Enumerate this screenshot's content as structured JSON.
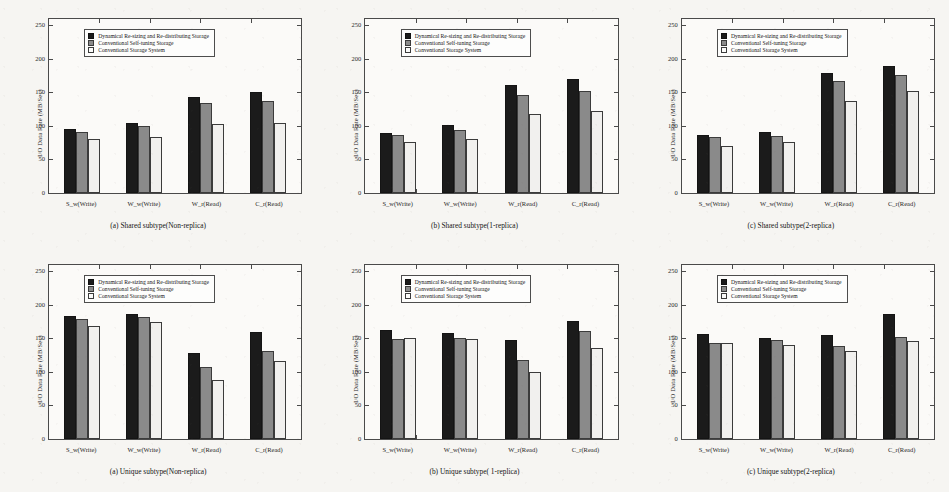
{
  "figure": {
    "ylabel": "I/O Data Rate (MB/Sec)",
    "y_ticks": [
      "0",
      "50",
      "100",
      "150",
      "200",
      "250"
    ],
    "legend": [
      "Dynamical Re-sizing and Re-distributing Storage",
      "Conventional Self-tuning Storage",
      "Conventional Storage System"
    ],
    "colors": {
      "series0": "#1b1b1b",
      "series1": "#8a8a8a",
      "series2": "#f1f0ee",
      "axis": "#4a4a4a",
      "page_background": "#f6f5f2"
    }
  },
  "chart_data": [
    {
      "type": "bar",
      "title": "(a) Shared subtype(Non-replica)",
      "xlabel": "",
      "ylabel": "I/O Data Rate (MB/Sec)",
      "ylim": [
        0,
        260
      ],
      "yticks": [
        0,
        50,
        100,
        150,
        200,
        250
      ],
      "grid": false,
      "legend_position": "upper-left-inside",
      "categories": [
        "S_w(Write)",
        "W_w(Write)",
        "W_r(Read)",
        "C_r(Read)"
      ],
      "series": [
        {
          "name": "Dynamical Re-sizing and Re-distributing Storage",
          "values": [
            95,
            104,
            144,
            151
          ]
        },
        {
          "name": "Conventional Self-tuning Storage",
          "values": [
            91,
            100,
            134,
            138
          ]
        },
        {
          "name": "Conventional Storage System",
          "values": [
            81,
            83,
            103,
            105
          ]
        }
      ]
    },
    {
      "type": "bar",
      "title": "(b) Shared subtype(1-replica)",
      "xlabel": "",
      "ylabel": "I/O Data Rate (MB/Sec)",
      "ylim": [
        0,
        260
      ],
      "yticks": [
        0,
        50,
        100,
        150,
        200,
        250
      ],
      "grid": false,
      "legend_position": "upper-left-inside",
      "categories": [
        "S_w(Write)",
        "W_w(Write)",
        "W_r(Read)",
        "C_r(Read)"
      ],
      "series": [
        {
          "name": "Dynamical Re-sizing and Re-distributing Storage",
          "values": [
            90,
            101,
            162,
            170
          ]
        },
        {
          "name": "Conventional Self-tuning Storage",
          "values": [
            87,
            94,
            147,
            152
          ]
        },
        {
          "name": "Conventional Storage System",
          "values": [
            76,
            80,
            118,
            122
          ]
        }
      ]
    },
    {
      "type": "bar",
      "title": "(c) Shared subtype(2-replica)",
      "xlabel": "",
      "ylabel": "I/O Data Rate (MB/Sec)",
      "ylim": [
        0,
        260
      ],
      "yticks": [
        0,
        50,
        100,
        150,
        200,
        250
      ],
      "grid": false,
      "legend_position": "upper-left-inside",
      "categories": [
        "S_w(Write)",
        "W_w(Write)",
        "W_r(Read)",
        "C_r(Read)"
      ],
      "series": [
        {
          "name": "Dynamical Re-sizing and Re-distributing Storage",
          "values": [
            87,
            91,
            180,
            190
          ]
        },
        {
          "name": "Conventional Self-tuning Storage",
          "values": [
            83,
            85,
            167,
            176
          ]
        },
        {
          "name": "Conventional Storage System",
          "values": [
            71,
            76,
            138,
            152
          ]
        }
      ]
    },
    {
      "type": "bar",
      "title": "(a) Unique subtype(Non-replica)",
      "xlabel": "",
      "ylabel": "I/O Data Rate (MB/Sec)",
      "ylim": [
        0,
        260
      ],
      "yticks": [
        0,
        50,
        100,
        150,
        200,
        250
      ],
      "grid": false,
      "legend_position": "upper-left-inside",
      "categories": [
        "S_w(Write)",
        "W_w(Write)",
        "W_r(Read)",
        "C_r(Read)"
      ],
      "series": [
        {
          "name": "Dynamical Re-sizing and Re-distributing Storage",
          "values": [
            184,
            187,
            128,
            160
          ]
        },
        {
          "name": "Conventional Self-tuning Storage",
          "values": [
            179,
            182,
            108,
            132
          ]
        },
        {
          "name": "Conventional Storage System",
          "values": [
            169,
            175,
            88,
            117
          ]
        }
      ]
    },
    {
      "type": "bar",
      "title": "(b) Unique subtype( 1-replica)",
      "xlabel": "",
      "ylabel": "I/O Data Rate (MB/Sec)",
      "ylim": [
        0,
        260
      ],
      "yticks": [
        0,
        50,
        100,
        150,
        200,
        250
      ],
      "grid": false,
      "legend_position": "upper-left-inside",
      "categories": [
        "S_w(Write)",
        "W_w(Write)",
        "W_r(Read)",
        "C_r(Read)"
      ],
      "series": [
        {
          "name": "Dynamical Re-sizing and Re-distributing Storage",
          "values": [
            163,
            159,
            148,
            176
          ]
        },
        {
          "name": "Conventional Self-tuning Storage",
          "values": [
            149,
            151,
            118,
            162
          ]
        },
        {
          "name": "Conventional Storage System",
          "values": [
            151,
            149,
            100,
            136
          ]
        }
      ]
    },
    {
      "type": "bar",
      "title": "(c) Unique subtype(2-replica)",
      "xlabel": "",
      "ylabel": "I/O Data Rate (MB/Sec)",
      "ylim": [
        0,
        260
      ],
      "yticks": [
        0,
        50,
        100,
        150,
        200,
        250
      ],
      "grid": false,
      "legend_position": "upper-left-inside",
      "categories": [
        "S_w(Write)",
        "W_w(Write)",
        "W_r(Read)",
        "C_r(Read)"
      ],
      "series": [
        {
          "name": "Dynamical Re-sizing and Re-distributing Storage",
          "values": [
            157,
            151,
            156,
            187
          ]
        },
        {
          "name": "Conventional Self-tuning Storage",
          "values": [
            143,
            148,
            139,
            152
          ]
        },
        {
          "name": "Conventional Storage System",
          "values": [
            144,
            140,
            131,
            147
          ]
        }
      ]
    }
  ]
}
